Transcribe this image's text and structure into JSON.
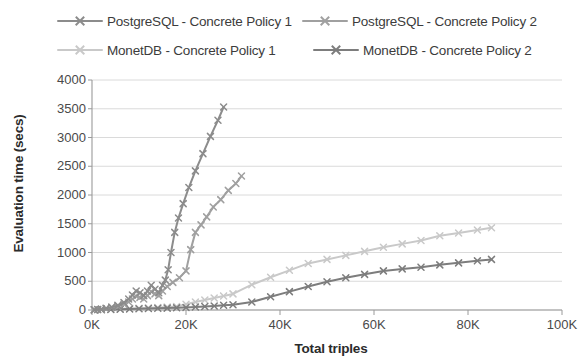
{
  "legend": {
    "position": "top",
    "items": [
      {
        "label": "PostgreSQL - Concrete Policy 1",
        "color": "#8c8c8c",
        "key": "pg1"
      },
      {
        "label": "PostgreSQL - Concrete Policy 2",
        "color": "#a0a0a0",
        "key": "pg2"
      },
      {
        "label": "MonetDB - Concrete Policy 1",
        "color": "#c9c9c9",
        "key": "md1"
      },
      {
        "label": "MonetDB - Concrete Policy 2",
        "color": "#7d7d7d",
        "key": "md2"
      }
    ]
  },
  "axes": {
    "x_title": "Total triples",
    "y_title": "Evaluation time (secs)",
    "x_ticks": [
      "0K",
      "20K",
      "40K",
      "60K",
      "80K",
      "100K"
    ],
    "y_ticks": [
      "4000",
      "3500",
      "3000",
      "2500",
      "2000",
      "1500",
      "1000",
      "500",
      "0"
    ]
  },
  "chart_data": {
    "type": "line",
    "title": "",
    "xlabel": "Total triples",
    "ylabel": "Evaluation time (secs)",
    "xlim": [
      0,
      100000
    ],
    "ylim": [
      0,
      4000
    ],
    "xtick_values": [
      0,
      20000,
      40000,
      60000,
      80000,
      100000
    ],
    "xtick_labels": [
      "0K",
      "20K",
      "40K",
      "60K",
      "80K",
      "100K"
    ],
    "ytick_values": [
      0,
      500,
      1000,
      1500,
      2000,
      2500,
      3000,
      3500,
      4000
    ],
    "grid": "horizontal",
    "legend_position": "top",
    "series": [
      {
        "name": "PostgreSQL - Concrete Policy 1",
        "color": "#8c8c8c",
        "marker": "x",
        "points": [
          [
            500,
            5
          ],
          [
            1200,
            10
          ],
          [
            2000,
            18
          ],
          [
            3000,
            30
          ],
          [
            4200,
            50
          ],
          [
            5500,
            80
          ],
          [
            6800,
            130
          ],
          [
            7800,
            190
          ],
          [
            8600,
            260
          ],
          [
            9400,
            330
          ],
          [
            10200,
            300
          ],
          [
            11000,
            250
          ],
          [
            11800,
            330
          ],
          [
            12600,
            430
          ],
          [
            13400,
            360
          ],
          [
            14200,
            300
          ],
          [
            15000,
            430
          ],
          [
            15600,
            520
          ],
          [
            16200,
            700
          ],
          [
            16800,
            1000
          ],
          [
            17600,
            1350
          ],
          [
            18400,
            1600
          ],
          [
            19400,
            1850
          ],
          [
            20600,
            2130
          ],
          [
            22000,
            2420
          ],
          [
            23600,
            2720
          ],
          [
            25200,
            3020
          ],
          [
            26800,
            3300
          ],
          [
            28000,
            3530
          ]
        ]
      },
      {
        "name": "PostgreSQL - Concrete Policy 2",
        "color": "#a0a0a0",
        "marker": "x",
        "points": [
          [
            500,
            5
          ],
          [
            1200,
            8
          ],
          [
            2000,
            14
          ],
          [
            3000,
            25
          ],
          [
            4200,
            42
          ],
          [
            5500,
            65
          ],
          [
            6800,
            100
          ],
          [
            7800,
            140
          ],
          [
            8600,
            190
          ],
          [
            9400,
            240
          ],
          [
            10200,
            220
          ],
          [
            11000,
            190
          ],
          [
            11800,
            250
          ],
          [
            12600,
            320
          ],
          [
            13400,
            280
          ],
          [
            14200,
            250
          ],
          [
            15000,
            330
          ],
          [
            16000,
            410
          ],
          [
            17200,
            480
          ],
          [
            18600,
            560
          ],
          [
            20000,
            680
          ],
          [
            21000,
            1050
          ],
          [
            22000,
            1350
          ],
          [
            23200,
            1480
          ],
          [
            24400,
            1620
          ],
          [
            25800,
            1790
          ],
          [
            27400,
            1920
          ],
          [
            29000,
            2080
          ],
          [
            30600,
            2200
          ],
          [
            31800,
            2330
          ]
        ]
      },
      {
        "name": "MonetDB - Concrete Policy 1",
        "color": "#c9c9c9",
        "marker": "x",
        "points": [
          [
            500,
            3
          ],
          [
            2000,
            8
          ],
          [
            4000,
            14
          ],
          [
            6000,
            20
          ],
          [
            8000,
            26
          ],
          [
            10000,
            32
          ],
          [
            12000,
            38
          ],
          [
            14000,
            44
          ],
          [
            16000,
            52
          ],
          [
            18000,
            62
          ],
          [
            20000,
            100
          ],
          [
            22000,
            140
          ],
          [
            24000,
            175
          ],
          [
            26000,
            210
          ],
          [
            28000,
            245
          ],
          [
            30000,
            280
          ],
          [
            34000,
            440
          ],
          [
            38000,
            570
          ],
          [
            42000,
            690
          ],
          [
            46000,
            810
          ],
          [
            50000,
            880
          ],
          [
            54000,
            950
          ],
          [
            58000,
            1020
          ],
          [
            62000,
            1090
          ],
          [
            66000,
            1150
          ],
          [
            70000,
            1210
          ],
          [
            74000,
            1290
          ],
          [
            78000,
            1340
          ],
          [
            82000,
            1390
          ],
          [
            85000,
            1430
          ]
        ]
      },
      {
        "name": "MonetDB - Concrete Policy 2",
        "color": "#7d7d7d",
        "marker": "x",
        "points": [
          [
            500,
            2
          ],
          [
            2000,
            5
          ],
          [
            4000,
            9
          ],
          [
            6000,
            13
          ],
          [
            8000,
            17
          ],
          [
            10000,
            21
          ],
          [
            12000,
            25
          ],
          [
            14000,
            29
          ],
          [
            16000,
            33
          ],
          [
            18000,
            38
          ],
          [
            20000,
            44
          ],
          [
            22000,
            52
          ],
          [
            24000,
            60
          ],
          [
            26000,
            70
          ],
          [
            28000,
            82
          ],
          [
            30000,
            92
          ],
          [
            34000,
            140
          ],
          [
            38000,
            230
          ],
          [
            42000,
            320
          ],
          [
            46000,
            410
          ],
          [
            50000,
            490
          ],
          [
            54000,
            560
          ],
          [
            58000,
            620
          ],
          [
            62000,
            680
          ],
          [
            66000,
            715
          ],
          [
            70000,
            745
          ],
          [
            74000,
            785
          ],
          [
            78000,
            820
          ],
          [
            82000,
            855
          ],
          [
            85000,
            880
          ]
        ]
      }
    ]
  }
}
